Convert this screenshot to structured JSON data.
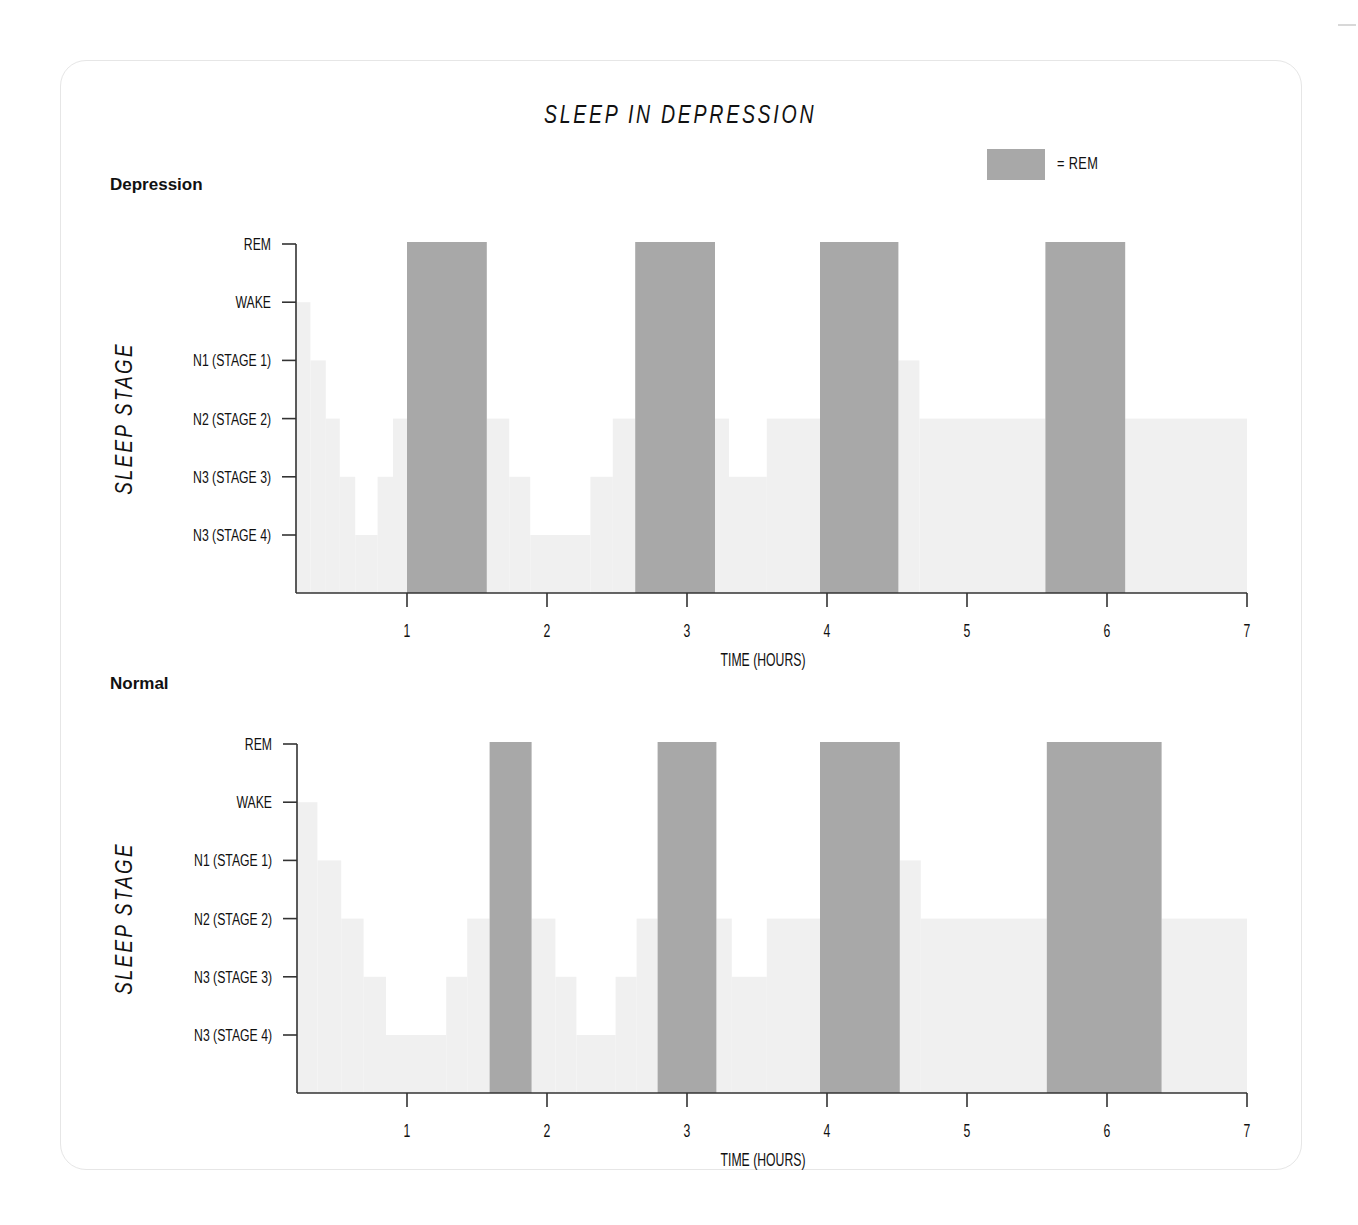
{
  "title": "SLEEP IN DEPRESSION",
  "legend": {
    "label": "= REM",
    "color": "#a8a8a8"
  },
  "colors": {
    "rem": "#a8a8a8",
    "stage_fill": "#f0f0f0",
    "axis": "#333333"
  },
  "chart_data": [
    {
      "type": "area",
      "subtype": "hypnogram-step",
      "panel_label": "Depression",
      "title": "SLEEP IN DEPRESSION",
      "xlabel": "TIME (HOURS)",
      "ylabel": "SLEEP STAGE",
      "x_ticks": [
        1,
        2,
        3,
        4,
        5,
        6,
        7
      ],
      "xlim": [
        0.2,
        7
      ],
      "y_levels": [
        "REM",
        "WAKE",
        "N1 (STAGE 1)",
        "N2 (STAGE 2)",
        "N3 (STAGE 3)",
        "N3 (STAGE 4)"
      ],
      "grid": false,
      "segments": [
        {
          "start": 0.2,
          "end": 0.22,
          "stage": "WAKE"
        },
        {
          "start": 0.22,
          "end": 0.2,
          "stage": "WAKE"
        },
        {
          "start": 0.2,
          "end": 0.31,
          "stage": "WAKE"
        },
        {
          "start": 0.31,
          "end": 0.42,
          "stage": "N1 (STAGE 1)"
        },
        {
          "start": 0.42,
          "end": 0.52,
          "stage": "N2 (STAGE 2)"
        },
        {
          "start": 0.52,
          "end": 0.63,
          "stage": "N3 (STAGE 3)"
        },
        {
          "start": 0.63,
          "end": 0.79,
          "stage": "N3 (STAGE 4)"
        },
        {
          "start": 0.79,
          "end": 0.9,
          "stage": "N3 (STAGE 3)"
        },
        {
          "start": 0.9,
          "end": 1.0,
          "stage": "N2 (STAGE 2)"
        },
        {
          "start": 1.0,
          "end": 1.57,
          "stage": "REM"
        },
        {
          "start": 1.57,
          "end": 1.73,
          "stage": "N2 (STAGE 2)"
        },
        {
          "start": 1.73,
          "end": 1.88,
          "stage": "N3 (STAGE 3)"
        },
        {
          "start": 1.88,
          "end": 2.31,
          "stage": "N3 (STAGE 4)"
        },
        {
          "start": 2.31,
          "end": 2.47,
          "stage": "N3 (STAGE 3)"
        },
        {
          "start": 2.47,
          "end": 2.63,
          "stage": "N2 (STAGE 2)"
        },
        {
          "start": 2.63,
          "end": 3.2,
          "stage": "REM"
        },
        {
          "start": 3.2,
          "end": 3.3,
          "stage": "N2 (STAGE 2)"
        },
        {
          "start": 3.3,
          "end": 3.57,
          "stage": "N3 (STAGE 3)"
        },
        {
          "start": 3.57,
          "end": 3.95,
          "stage": "N2 (STAGE 2)"
        },
        {
          "start": 3.95,
          "end": 4.51,
          "stage": "REM"
        },
        {
          "start": 4.51,
          "end": 4.66,
          "stage": "N1 (STAGE 1)"
        },
        {
          "start": 4.66,
          "end": 5.56,
          "stage": "N2 (STAGE 2)"
        },
        {
          "start": 5.56,
          "end": 6.13,
          "stage": "REM"
        },
        {
          "start": 6.13,
          "end": 7.0,
          "stage": "N2 (STAGE 2)"
        }
      ]
    },
    {
      "type": "area",
      "subtype": "hypnogram-step",
      "panel_label": "Normal",
      "xlabel": "TIME (HOURS)",
      "ylabel": "SLEEP STAGE",
      "x_ticks": [
        1,
        2,
        3,
        4,
        5,
        6,
        7
      ],
      "xlim": [
        0.2,
        7
      ],
      "y_levels": [
        "REM",
        "WAKE",
        "N1 (STAGE 1)",
        "N2 (STAGE 2)",
        "N3 (STAGE 3)",
        "N3 (STAGE 4)"
      ],
      "grid": false,
      "segments": [
        {
          "start": 0.2,
          "end": 0.36,
          "stage": "WAKE"
        },
        {
          "start": 0.36,
          "end": 0.53,
          "stage": "N1 (STAGE 1)"
        },
        {
          "start": 0.53,
          "end": 0.69,
          "stage": "N2 (STAGE 2)"
        },
        {
          "start": 0.69,
          "end": 0.85,
          "stage": "N3 (STAGE 3)"
        },
        {
          "start": 0.85,
          "end": 1.28,
          "stage": "N3 (STAGE 4)"
        },
        {
          "start": 1.28,
          "end": 1.43,
          "stage": "N3 (STAGE 3)"
        },
        {
          "start": 1.43,
          "end": 1.59,
          "stage": "N2 (STAGE 2)"
        },
        {
          "start": 1.59,
          "end": 1.89,
          "stage": "REM"
        },
        {
          "start": 1.89,
          "end": 2.06,
          "stage": "N2 (STAGE 2)"
        },
        {
          "start": 2.06,
          "end": 2.21,
          "stage": "N3 (STAGE 3)"
        },
        {
          "start": 2.21,
          "end": 2.49,
          "stage": "N3 (STAGE 4)"
        },
        {
          "start": 2.49,
          "end": 2.64,
          "stage": "N3 (STAGE 3)"
        },
        {
          "start": 2.64,
          "end": 2.79,
          "stage": "N2 (STAGE 2)"
        },
        {
          "start": 2.79,
          "end": 3.21,
          "stage": "REM"
        },
        {
          "start": 3.21,
          "end": 3.32,
          "stage": "N2 (STAGE 2)"
        },
        {
          "start": 3.32,
          "end": 3.57,
          "stage": "N3 (STAGE 3)"
        },
        {
          "start": 3.57,
          "end": 3.95,
          "stage": "N2 (STAGE 2)"
        },
        {
          "start": 3.95,
          "end": 4.52,
          "stage": "REM"
        },
        {
          "start": 4.52,
          "end": 4.67,
          "stage": "N1 (STAGE 1)"
        },
        {
          "start": 4.67,
          "end": 5.57,
          "stage": "N2 (STAGE 2)"
        },
        {
          "start": 5.57,
          "end": 6.39,
          "stage": "REM"
        },
        {
          "start": 6.39,
          "end": 7.0,
          "stage": "N2 (STAGE 2)"
        }
      ]
    }
  ]
}
